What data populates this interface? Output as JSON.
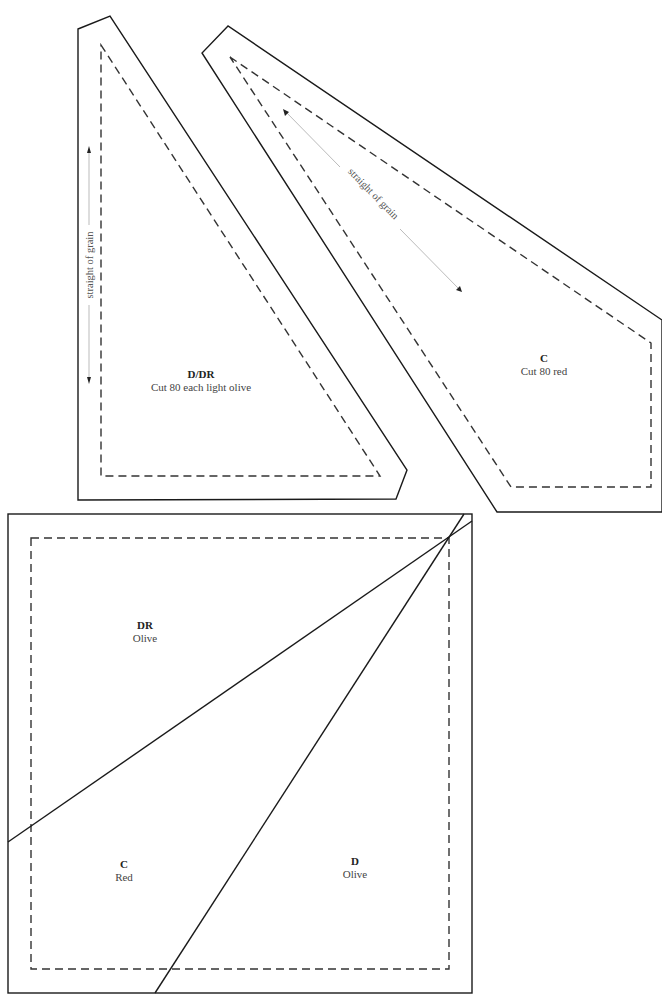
{
  "templates": {
    "d_dr": {
      "name": "D/DR",
      "instruction": "Cut 80 each light olive",
      "grain_label": "straight of grain"
    },
    "c": {
      "name": "C",
      "instruction": "Cut 80 red",
      "grain_label": "straight of grain"
    }
  },
  "block": {
    "pieces": [
      {
        "name": "DR",
        "color": "Olive"
      },
      {
        "name": "C",
        "color": "Red"
      },
      {
        "name": "D",
        "color": "Olive"
      }
    ]
  }
}
